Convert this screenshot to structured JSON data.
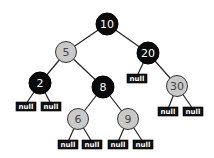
{
  "diagram": {
    "type": "red-black-tree",
    "colors": {
      "black": "#0a0a0a",
      "red": "#c9c9c9",
      "null": "#111111"
    },
    "null_label": "null",
    "nodes": [
      {
        "id": "n10",
        "value": "10",
        "color": "black",
        "x": 107,
        "y": 24
      },
      {
        "id": "n5",
        "value": "5",
        "color": "red",
        "x": 66,
        "y": 52
      },
      {
        "id": "n20",
        "value": "20",
        "color": "black",
        "x": 148,
        "y": 53
      },
      {
        "id": "n2",
        "value": "2",
        "color": "black",
        "x": 40,
        "y": 83
      },
      {
        "id": "n8",
        "value": "8",
        "color": "black",
        "x": 103,
        "y": 87
      },
      {
        "id": "n30",
        "value": "30",
        "color": "red",
        "x": 177,
        "y": 86
      },
      {
        "id": "n6",
        "value": "6",
        "color": "red",
        "x": 78,
        "y": 119
      },
      {
        "id": "n9",
        "value": "9",
        "color": "red",
        "x": 128,
        "y": 119
      }
    ],
    "nulls": [
      {
        "parent": "2",
        "side": "left",
        "x": 16,
        "y": 102
      },
      {
        "parent": "2",
        "side": "right",
        "x": 41,
        "y": 102
      },
      {
        "parent": "20",
        "side": "left",
        "x": 127,
        "y": 74
      },
      {
        "parent": "30",
        "side": "left",
        "x": 158,
        "y": 107
      },
      {
        "parent": "30",
        "side": "right",
        "x": 183,
        "y": 107
      },
      {
        "parent": "6",
        "side": "left",
        "x": 58,
        "y": 140
      },
      {
        "parent": "6",
        "side": "right",
        "x": 82,
        "y": 140
      },
      {
        "parent": "9",
        "side": "left",
        "x": 108,
        "y": 140
      },
      {
        "parent": "9",
        "side": "right",
        "x": 133,
        "y": 140
      }
    ]
  }
}
